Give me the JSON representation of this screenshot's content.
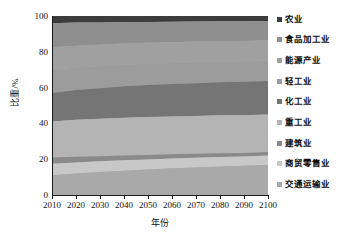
{
  "chart_data": {
    "type": "area",
    "title": "",
    "xlabel": "年份",
    "ylabel": "比重/%",
    "xlim": [
      2010,
      2100
    ],
    "ylim": [
      0,
      100
    ],
    "grid": false,
    "stacked": true,
    "stack_mode": "percent",
    "legend_position": "right",
    "x": [
      2010,
      2020,
      2030,
      2040,
      2050,
      2060,
      2070,
      2080,
      2090,
      2100
    ],
    "x_tick_labels": [
      "2010",
      "2020",
      "2030",
      "2040",
      "2050",
      "2060",
      "2070",
      "2080",
      "2090",
      "2100"
    ],
    "y_tick_labels": [
      "0",
      "20",
      "40",
      "60",
      "80",
      "100"
    ],
    "y_ticks": [
      0,
      20,
      40,
      60,
      80,
      100
    ],
    "series": [
      {
        "name": "交通运输业",
        "color": "#a9a9a9",
        "values": [
          11.0,
          12.0,
          12.8,
          13.6,
          14.3,
          14.9,
          15.4,
          15.9,
          16.3,
          16.8
        ]
      },
      {
        "name": "商贸零售业",
        "color": "#c8c8c8",
        "values": [
          6.5,
          6.2,
          6.0,
          5.8,
          5.6,
          5.5,
          5.4,
          5.3,
          5.2,
          5.2
        ]
      },
      {
        "name": "建筑业",
        "color": "#8a8a8a",
        "values": [
          3.5,
          3.2,
          2.9,
          2.7,
          2.5,
          2.3,
          2.2,
          2.1,
          2.0,
          2.0
        ]
      },
      {
        "name": "重工业",
        "color": "#b4b4b4",
        "values": [
          20.0,
          20.6,
          20.9,
          21.1,
          21.2,
          21.2,
          21.2,
          21.2,
          21.1,
          21.0
        ]
      },
      {
        "name": "化工业",
        "color": "#757575",
        "values": [
          16.0,
          16.6,
          17.1,
          17.5,
          17.8,
          18.1,
          18.3,
          18.5,
          18.6,
          18.7
        ]
      },
      {
        "name": "轻工业",
        "color": "#9c9c9c",
        "values": [
          13.0,
          12.6,
          12.3,
          12.1,
          11.9,
          11.8,
          11.7,
          11.6,
          11.5,
          11.4
        ]
      },
      {
        "name": "能源产业",
        "color": "#a0a0a0",
        "values": [
          12.5,
          12.2,
          12.0,
          11.8,
          11.7,
          11.6,
          11.5,
          11.4,
          11.4,
          11.3
        ]
      },
      {
        "name": "食品加工业",
        "color": "#8f8f8f",
        "values": [
          13.5,
          12.9,
          12.4,
          12.0,
          11.7,
          11.4,
          11.2,
          11.0,
          10.9,
          10.8
        ]
      },
      {
        "name": "农业",
        "color": "#3c3c3c",
        "values": [
          4.0,
          3.7,
          3.6,
          3.4,
          3.3,
          3.2,
          3.1,
          3.0,
          3.0,
          2.8
        ]
      }
    ],
    "legend_entries": [
      {
        "label": "农业",
        "color": "#3c3c3c"
      },
      {
        "label": "食品加工业",
        "color": "#8f8f8f"
      },
      {
        "label": "能源产业",
        "color": "#a0a0a0"
      },
      {
        "label": "轻工业",
        "color": "#9c9c9c"
      },
      {
        "label": "化工业",
        "color": "#757575"
      },
      {
        "label": "重工业",
        "color": "#b4b4b4"
      },
      {
        "label": "建筑业",
        "color": "#8a8a8a"
      },
      {
        "label": "商贸零售业",
        "color": "#c8c8c8"
      },
      {
        "label": "交通运输业",
        "color": "#a9a9a9"
      }
    ]
  }
}
